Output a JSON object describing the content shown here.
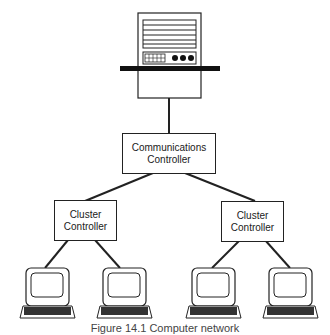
{
  "diagram": {
    "host": {
      "label": ""
    },
    "comm_controller": {
      "line1": "Communications",
      "line2": "Controller"
    },
    "cluster_left": {
      "line1": "Cluster",
      "line2": "Controller"
    },
    "cluster_right": {
      "line1": "Cluster",
      "line2": "Controller"
    },
    "terminals": [
      "terminal",
      "terminal",
      "terminal",
      "terminal"
    ],
    "caption": "Figure 14.1  Computer network"
  },
  "colors": {
    "line": "#222222",
    "background": "#ffffff"
  }
}
